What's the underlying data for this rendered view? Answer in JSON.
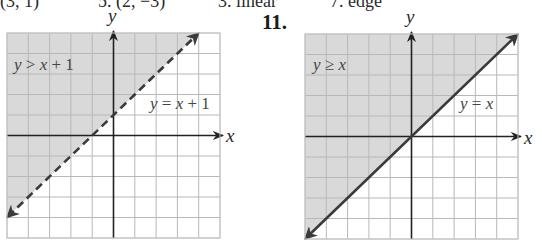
{
  "header_fragment": {
    "items": [
      {
        "text": "(3, 1)",
        "x": 0
      },
      {
        "text": "5. (2, −3)",
        "x": 98
      },
      {
        "text": "3. linear",
        "x": 218
      },
      {
        "text": "7. edge",
        "x": 330
      }
    ]
  },
  "exercise_number": "11.",
  "chart_data": [
    {
      "type": "inequality-graph",
      "title": "",
      "xlabel": "x",
      "ylabel": "y",
      "xlim": [
        -5,
        5
      ],
      "ylim": [
        -5,
        5
      ],
      "grid": true,
      "grid_step": 1,
      "boundary": {
        "equation": "y = x + 1",
        "slope": 1,
        "intercept": 1,
        "style": "dashed"
      },
      "shaded_region": "above",
      "region_label": "y > x + 1",
      "line_label": "y = x + 1",
      "colors": {
        "shade": "#d9d9d9",
        "grid": "#b8b8b8",
        "line": "#3a3a3a",
        "axis": "#222222"
      }
    },
    {
      "type": "inequality-graph",
      "title": "",
      "xlabel": "x",
      "ylabel": "y",
      "xlim": [
        -5,
        5
      ],
      "ylim": [
        -5,
        5
      ],
      "grid": true,
      "grid_step": 1,
      "boundary": {
        "equation": "y = x",
        "slope": 1,
        "intercept": 0,
        "style": "solid"
      },
      "shaded_region": "above",
      "region_label": "y ≥ x",
      "line_label": "y = x",
      "colors": {
        "shade": "#d9d9d9",
        "grid": "#b8b8b8",
        "line": "#3a3a3a",
        "axis": "#222222"
      }
    }
  ]
}
